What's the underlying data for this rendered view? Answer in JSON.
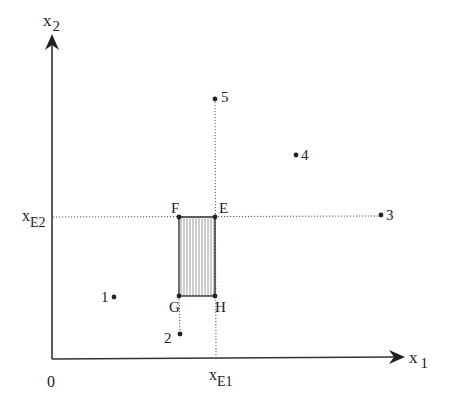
{
  "diagram": {
    "axes": {
      "x1_label": "x",
      "x1_sub": "1",
      "x2_label": "x",
      "x2_sub": "2",
      "origin_label": "0",
      "xE1_label": "x",
      "xE1_sub": "E1",
      "xE2_label": "x",
      "xE2_sub": "E2"
    },
    "rectangle_corners": {
      "F": "F",
      "E": "E",
      "G": "G",
      "H": "H"
    },
    "points": [
      {
        "id": "1",
        "label": "1"
      },
      {
        "id": "2",
        "label": "2"
      },
      {
        "id": "3",
        "label": "3"
      },
      {
        "id": "4",
        "label": "4"
      },
      {
        "id": "5",
        "label": "5"
      }
    ],
    "colors": {
      "ink": "#222222",
      "hatch": "#9a9a9a",
      "dotted": "#555555"
    }
  }
}
